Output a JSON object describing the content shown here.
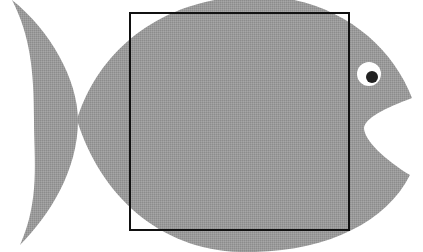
{
  "image": {
    "description": "Grey fish silhouette with open mouth facing right, overlaid with a black square outline",
    "colors": {
      "background": "#ffffff",
      "fish_fill": "#9a9a9a",
      "square_stroke": "#111111",
      "eye_white": "#ffffff",
      "pupil": "#222222"
    },
    "shapes": {
      "fish": "fish-silhouette",
      "square": "square-outline",
      "eye": "eye-icon"
    }
  }
}
